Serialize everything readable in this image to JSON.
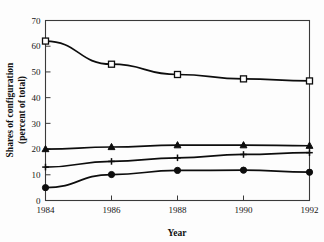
{
  "chart_data": {
    "type": "line",
    "title": "",
    "xlabel": "Year",
    "ylabel": "Shares of configuration (percent of total)",
    "ylabel_line1": "Shares of configuration",
    "ylabel_line2": "(percent of total)",
    "x": [
      1984,
      1986,
      1988,
      1990,
      1992
    ],
    "xticklabels": [
      "1984",
      "1986",
      "1988",
      "1990",
      "1992"
    ],
    "yticks": [
      0,
      10,
      20,
      30,
      40,
      50,
      60,
      70
    ],
    "yticklabels": [
      "0",
      "10",
      "20",
      "30",
      "40",
      "50",
      "60",
      "70"
    ],
    "ylim": [
      0,
      70
    ],
    "xlim": [
      1984,
      1992
    ],
    "grid": false,
    "legend": "none",
    "series": [
      {
        "name": "series-open-square",
        "marker": "open-square",
        "values": [
          62.0,
          53.0,
          49.0,
          47.3,
          46.5
        ]
      },
      {
        "name": "series-filled-triangle",
        "marker": "filled-triangle",
        "values": [
          20.0,
          20.8,
          21.5,
          21.5,
          21.3
        ]
      },
      {
        "name": "series-plus",
        "marker": "plus",
        "values": [
          13.0,
          15.2,
          16.6,
          17.9,
          18.6
        ]
      },
      {
        "name": "series-filled-circle",
        "marker": "filled-circle",
        "values": [
          5.0,
          10.1,
          11.7,
          11.8,
          11.0
        ]
      }
    ]
  }
}
